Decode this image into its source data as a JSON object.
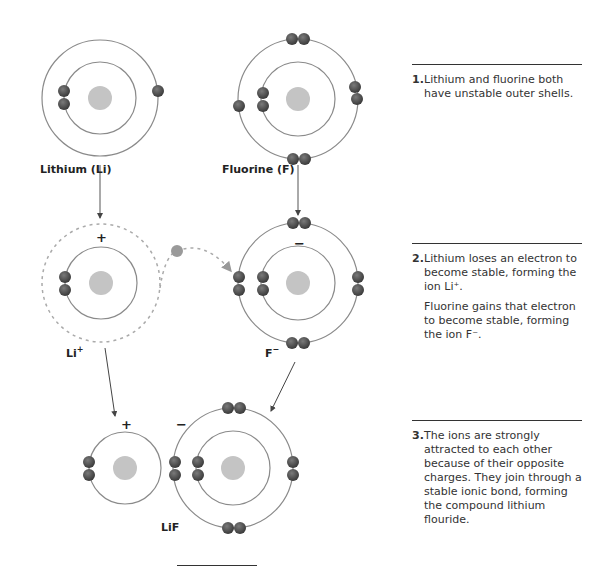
{
  "labels": {
    "lithium": "Lithium (Li)",
    "fluorine": "Fluorine (F)",
    "li_ion": "Li",
    "li_ion_sup": "+",
    "f_ion": "F",
    "f_ion_sup": "−",
    "compound": "LiF",
    "plus": "+",
    "minus": "−"
  },
  "steps": [
    {
      "number": "1.",
      "text": "Lithium and fluorine both have unstable outer shells."
    },
    {
      "number": "2.",
      "text": "Lithium loses an electron to become stable, forming the ion Li⁺.",
      "extra": "Fluorine gains that electron to become stable, forming the ion F⁻."
    },
    {
      "number": "3.",
      "text": "The ions are strongly attracted to each other because of their opposite charges. They join through a stable ionic bond, forming the compound lithium flouride."
    }
  ],
  "colors": {
    "electron": "#4a4a4a",
    "nucleus": "#c4c4c4",
    "shell": "#8a8a8a",
    "transfer_electron": "#9a9a9a"
  }
}
